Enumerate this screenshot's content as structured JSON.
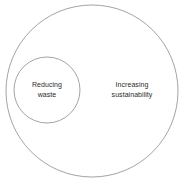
{
  "diagram": {
    "type": "euler-diagram",
    "background_color": "#ffffff",
    "stroke_color": "#8c8c8c",
    "text_color": "#2b2b2b",
    "sets": [
      {
        "name": "outer-set",
        "label_lines": [
          "Increasing",
          "sustainability"
        ],
        "label_text": "Increasing sustainability",
        "center_x": 92,
        "center_y": 91,
        "radius": 86
      },
      {
        "name": "inner-set",
        "label_lines": [
          "Reducing",
          "waste"
        ],
        "label_text": "Reducing waste",
        "center_x": 47,
        "center_y": 90,
        "radius": 33
      }
    ],
    "relationship": "inner-set is a subset of outer-set"
  }
}
